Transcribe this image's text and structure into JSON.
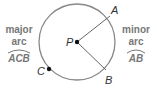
{
  "diagram": {
    "center_label": "P",
    "points": {
      "A": "A",
      "B": "B",
      "C": "C"
    },
    "major_arc": {
      "line1": "major",
      "line2": "arc",
      "name": "ACB"
    },
    "minor_arc": {
      "line1": "minor",
      "line2": "arc",
      "name": "AB"
    },
    "colors": {
      "circle": "#777777",
      "text": "#777777",
      "point": "#111111"
    }
  }
}
